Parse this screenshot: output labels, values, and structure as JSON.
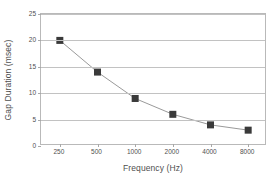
{
  "chart_data": {
    "type": "line",
    "title": "",
    "subtitle": "",
    "xlabel": "Frequency (Hz)",
    "ylabel": "Gap Duration (msec)",
    "categories": [
      "250",
      "500",
      "1000",
      "2000",
      "4000",
      "8000"
    ],
    "values": [
      20,
      14,
      9,
      6,
      4,
      3
    ],
    "series": [
      {
        "name": "Gap Duration",
        "values": [
          20,
          14,
          9,
          6,
          4,
          3
        ],
        "marker": "filled-square",
        "marker_color": "#3a3a3a",
        "line_color": "#9a9a9a"
      }
    ],
    "ylim": [
      0,
      25
    ],
    "y_ticks": [
      0,
      5,
      10,
      15,
      20,
      25
    ],
    "y_tick_labels": [
      "0",
      "5",
      "10",
      "15",
      "20",
      "25"
    ],
    "x_tick_labels": [
      "250",
      "500",
      "1000",
      "2000",
      "4000",
      "8000"
    ],
    "grid": "horizontal",
    "legend": "none",
    "plot_border": true,
    "colors": {
      "background": "#ffffff",
      "grid": "#c2c2c2",
      "border": "#b9b9b9",
      "text": "#4f4f4f",
      "marker": "#3a3a3a",
      "line": "#9a9a9a"
    }
  }
}
